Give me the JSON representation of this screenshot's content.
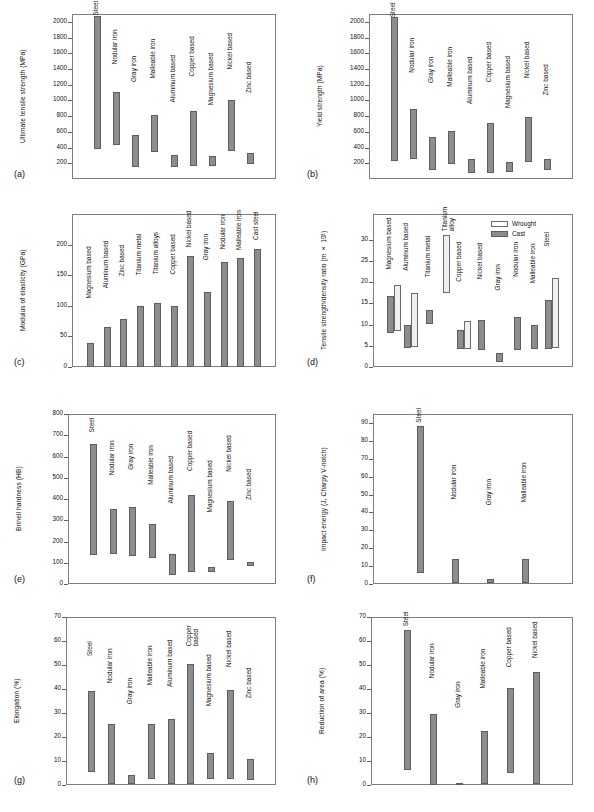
{
  "figure": {
    "panels": [
      "(a)",
      "(b)",
      "(c)",
      "(d)",
      "(e)",
      "(f)",
      "(g)",
      "(h)"
    ]
  },
  "chart_data": [
    {
      "id": "a",
      "panel_letter": "(a)",
      "type": "bar",
      "orientation": "floating-range",
      "title": "",
      "xlabel": "",
      "ylabel": "Ultimate tensile strength (MPa)",
      "ylim": [
        0,
        2100
      ],
      "yticks": [
        200,
        400,
        600,
        800,
        1000,
        1200,
        1400,
        1600,
        1800,
        2000
      ],
      "grid": false,
      "categories": [
        "Steel",
        "Nodular iron",
        "Gray iron",
        "Malleable iron",
        "Aluminum based",
        "Copper based",
        "Magnesium based",
        "Nickel based",
        "Zinc based"
      ],
      "ranges": [
        [
          380,
          2080
        ],
        [
          430,
          1105
        ],
        [
          155,
          560
        ],
        [
          345,
          820
        ],
        [
          150,
          300
        ],
        [
          160,
          860
        ],
        [
          160,
          290
        ],
        [
          355,
          1000
        ],
        [
          190,
          330
        ]
      ]
    },
    {
      "id": "b",
      "panel_letter": "(b)",
      "type": "bar",
      "orientation": "floating-range",
      "title": "",
      "xlabel": "",
      "ylabel": "Yield strength (MPa)",
      "ylim": [
        0,
        2100
      ],
      "yticks": [
        200,
        400,
        600,
        800,
        1000,
        1200,
        1400,
        1600,
        1800,
        2000
      ],
      "grid": false,
      "categories": [
        "Steel",
        "Nodular iron",
        "Gray iron",
        "Malleable iron",
        "Aluminum based",
        "Copper based",
        "Magnesium based",
        "Nickel based",
        "Zinc based"
      ],
      "ranges": [
        [
          230,
          2060
        ],
        [
          250,
          895
        ],
        [
          120,
          535
        ],
        [
          195,
          615
        ],
        [
          70,
          255
        ],
        [
          80,
          710
        ],
        [
          85,
          215
        ],
        [
          210,
          785
        ],
        [
          120,
          260
        ]
      ]
    },
    {
      "id": "c",
      "panel_letter": "(c)",
      "type": "bar",
      "orientation": "vertical",
      "title": "",
      "xlabel": "",
      "ylabel": "Modulus of elasticity (GPa)",
      "ylim": [
        0,
        250
      ],
      "yticks": [
        0,
        50,
        100,
        150,
        200
      ],
      "grid": false,
      "categories": [
        "Magnesium based",
        "Aluminum based",
        "Zinc based",
        "Titanium metal",
        "Titanium alloys",
        "Copper based",
        "Nickel based",
        "Gray iron",
        "Nodular iron",
        "Malleable iron",
        "Cast steel"
      ],
      "values": [
        40,
        65,
        78,
        99,
        104,
        99,
        181,
        122,
        171,
        178,
        193
      ]
    },
    {
      "id": "d",
      "panel_letter": "(d)",
      "type": "bar",
      "orientation": "floating-range-grouped",
      "title": "",
      "xlabel": "",
      "ylabel": "Tensile strength/density ratio (m × 10³)",
      "ylim": [
        0,
        36
      ],
      "yticks": [
        0,
        5,
        10,
        15,
        20,
        25,
        30
      ],
      "grid": false,
      "legend_position": "top-right",
      "series": [
        {
          "name": "Cast",
          "swatch": "#8d8d8d"
        },
        {
          "name": "Wrought",
          "swatch": "#efefef"
        }
      ],
      "categories": [
        "Magnesium based",
        "Aluminum based",
        "Titanium metal",
        "Titanium alloy",
        "Copper based",
        "Nickel based",
        "Gray iron",
        "Nodular iron",
        "Malleable iron",
        "Steel"
      ],
      "cast_ranges": [
        [
          8.0,
          16.8
        ],
        [
          4.4,
          9.8
        ],
        [
          10.1,
          13.3
        ],
        null,
        [
          4.2,
          8.8
        ],
        [
          4.1,
          11.0
        ],
        [
          1.1,
          3.2
        ],
        [
          4.1,
          11.8
        ],
        [
          4.2,
          9.8
        ],
        [
          4.3,
          15.8
        ]
      ],
      "wrought_ranges": [
        [
          8.4,
          19.4
        ],
        [
          4.6,
          17.5
        ],
        null,
        [
          17.5,
          31.0
        ],
        [
          4.3,
          10.9
        ],
        null,
        null,
        null,
        null,
        [
          4.4,
          21.0
        ]
      ]
    },
    {
      "id": "e",
      "panel_letter": "(e)",
      "type": "bar",
      "orientation": "floating-range",
      "title": "",
      "xlabel": "",
      "ylabel": "Brinell hardness (HB)",
      "ylim": [
        0,
        800
      ],
      "yticks": [
        0,
        100,
        200,
        300,
        400,
        500,
        600,
        700,
        800
      ],
      "grid": false,
      "categories": [
        "Steel",
        "Nodular iron",
        "Gray iron",
        "Malleable iron",
        "Aluminum based",
        "Copper based",
        "Magnesium based",
        "Nickel based",
        "Zinc based"
      ],
      "ranges": [
        [
          135,
          657
        ],
        [
          140,
          352
        ],
        [
          132,
          363
        ],
        [
          120,
          283
        ],
        [
          41,
          143
        ],
        [
          58,
          419
        ],
        [
          55,
          78
        ],
        [
          112,
          392
        ],
        [
          85,
          103
        ]
      ]
    },
    {
      "id": "f",
      "panel_letter": "(f)",
      "type": "bar",
      "orientation": "floating-range",
      "title": "",
      "xlabel": "",
      "ylabel": "Impact energy (J, Charpy V-notch)",
      "ylim": [
        0,
        95
      ],
      "yticks": [
        0,
        10,
        20,
        30,
        40,
        50,
        60,
        70,
        80,
        90
      ],
      "grid": false,
      "categories": [
        "Steel",
        "Nodular iron",
        "Gray iron",
        "Malleable iron"
      ],
      "ranges": [
        [
          6.0,
          88.5
        ],
        [
          0.5,
          14.2
        ],
        [
          0.3,
          2.6
        ],
        [
          0.5,
          13.8
        ]
      ]
    },
    {
      "id": "g",
      "panel_letter": "(g)",
      "type": "bar",
      "orientation": "floating-range",
      "title": "",
      "xlabel": "",
      "ylabel": "Elongation (%)",
      "ylim": [
        0,
        70
      ],
      "yticks": [
        0,
        10,
        20,
        30,
        40,
        50,
        60,
        70
      ],
      "grid": false,
      "categories": [
        "Steel",
        "Nodular iron",
        "Gray iron",
        "Malleable iron",
        "Aluminum based",
        "Copper based",
        "Magnesium based",
        "Nickel based",
        "Zinc based"
      ],
      "ranges": [
        [
          5.5,
          39.2
        ],
        [
          0.4,
          25.3
        ],
        [
          0.3,
          4.1
        ],
        [
          2.6,
          25.3
        ],
        [
          0.6,
          27.5
        ],
        [
          0.5,
          50.3
        ],
        [
          2.5,
          13.2
        ],
        [
          2.7,
          39.6
        ],
        [
          2.0,
          11.0
        ]
      ]
    },
    {
      "id": "h",
      "panel_letter": "(h)",
      "type": "bar",
      "orientation": "floating-range",
      "title": "",
      "xlabel": "",
      "ylabel": "Reduction of area (%)",
      "ylim": [
        0,
        70
      ],
      "yticks": [
        0,
        10,
        20,
        30,
        40,
        50,
        60,
        70
      ],
      "grid": false,
      "categories": [
        "Steel",
        "Nodular iron",
        "Gray iron",
        "Malleable iron",
        "Copper based",
        "Nickel based"
      ],
      "ranges": [
        [
          6.2,
          64.5
        ],
        [
          0.2,
          29.5
        ],
        [
          0.2,
          0.9
        ],
        [
          0.4,
          22.7
        ],
        [
          4.8,
          40.3
        ],
        [
          0.5,
          47.1
        ]
      ]
    }
  ]
}
